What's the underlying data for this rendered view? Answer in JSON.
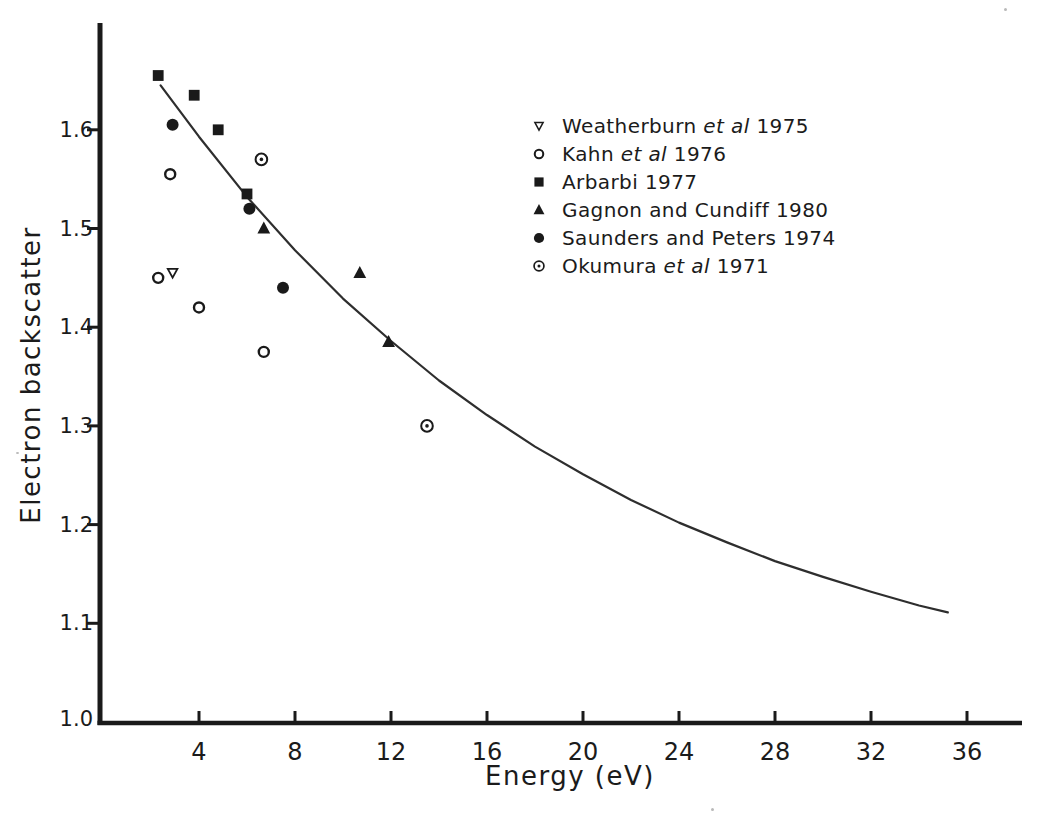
{
  "figure": {
    "background": "#ffffff",
    "ink_color": "#1a1a1a",
    "curve_color": "#2e2e2e"
  },
  "chart_data": {
    "type": "scatter",
    "title": "",
    "xlabel": "Energy (eV)",
    "ylabel": "Electron backscatter",
    "xlim": [
      0,
      38.3
    ],
    "ylim": [
      1.0,
      1.71
    ],
    "x_ticks": [
      4,
      8,
      12,
      16,
      20,
      24,
      28,
      32,
      36
    ],
    "y_ticks": [
      1.0,
      1.1,
      1.2,
      1.3,
      1.4,
      1.5,
      1.6
    ],
    "grid": false,
    "legend_position": "inside upper right",
    "series": [
      {
        "name": "Weatherburn et al 1975",
        "marker": "open-triangle-down",
        "label_parts": [
          {
            "text": "Weatherburn ",
            "italic": false
          },
          {
            "text": "et al",
            "italic": true
          },
          {
            "text": "  1975",
            "italic": false
          }
        ],
        "points": [
          [
            2.9,
            1.455
          ]
        ]
      },
      {
        "name": "Kahn et al 1976",
        "marker": "open-circle",
        "label_parts": [
          {
            "text": "Kahn ",
            "italic": false
          },
          {
            "text": "et al",
            "italic": true
          },
          {
            "text": "  1976",
            "italic": false
          }
        ],
        "points": [
          [
            2.3,
            1.45
          ],
          [
            2.8,
            1.555
          ],
          [
            4.0,
            1.42
          ],
          [
            6.7,
            1.375
          ]
        ]
      },
      {
        "name": "Arbarbi 1977",
        "marker": "filled-square",
        "label_parts": [
          {
            "text": "Arbarbi 1977",
            "italic": false
          }
        ],
        "points": [
          [
            2.3,
            1.655
          ],
          [
            3.8,
            1.635
          ],
          [
            4.8,
            1.6
          ],
          [
            6.0,
            1.535
          ]
        ]
      },
      {
        "name": "Gagnon and Cundiff 1980",
        "marker": "filled-triangle-up",
        "label_parts": [
          {
            "text": "Gagnon and Cundiff 1980",
            "italic": false
          }
        ],
        "points": [
          [
            6.7,
            1.5
          ],
          [
            10.7,
            1.455
          ],
          [
            11.9,
            1.385
          ]
        ]
      },
      {
        "name": "Saunders and Peters 1974",
        "marker": "filled-circle",
        "label_parts": [
          {
            "text": "Saunders and Peters 1974",
            "italic": false
          }
        ],
        "points": [
          [
            2.9,
            1.605
          ],
          [
            6.1,
            1.52
          ],
          [
            7.5,
            1.44
          ]
        ]
      },
      {
        "name": "Okumura et al 1971",
        "marker": "circle-dot",
        "label_parts": [
          {
            "text": "Okumura ",
            "italic": false
          },
          {
            "text": "et al",
            "italic": true
          },
          {
            "text": "  1971",
            "italic": false
          }
        ],
        "points": [
          [
            6.6,
            1.57
          ],
          [
            13.5,
            1.3
          ]
        ]
      }
    ],
    "fit_curve": {
      "type": "smooth-decay",
      "points": [
        [
          2.4,
          1.645
        ],
        [
          4,
          1.593
        ],
        [
          6,
          1.532
        ],
        [
          8,
          1.478
        ],
        [
          10,
          1.429
        ],
        [
          12,
          1.386
        ],
        [
          14,
          1.346
        ],
        [
          16,
          1.311
        ],
        [
          18,
          1.279
        ],
        [
          20,
          1.251
        ],
        [
          22,
          1.225
        ],
        [
          24,
          1.202
        ],
        [
          26,
          1.182
        ],
        [
          28,
          1.163
        ],
        [
          30,
          1.147
        ],
        [
          32,
          1.132
        ],
        [
          34,
          1.118
        ],
        [
          35.2,
          1.111
        ]
      ]
    }
  }
}
